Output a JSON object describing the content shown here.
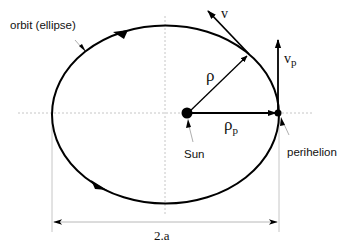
{
  "diagram": {
    "labels": {
      "orbit": "orbit (ellipse)",
      "velocity": "v",
      "velocity_perihelion": "v",
      "velocity_perihelion_sub": "p",
      "radius": "ρ",
      "radius_perihelion": "ρ",
      "radius_perihelion_sub": "p",
      "sun": "Sun",
      "perihelion": "perihelion",
      "major_axis": "2.a"
    },
    "colors": {
      "stroke": "#000000",
      "guide": "#b0b0b0",
      "leader": "#9a9a9a",
      "background": "#ffffff"
    }
  }
}
